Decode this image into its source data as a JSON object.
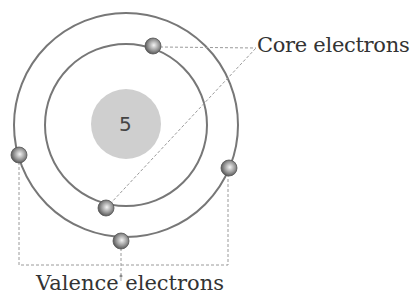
{
  "diagram": {
    "nucleus": {
      "label": "5",
      "color": "#cfcfcf",
      "cx": 126,
      "cy": 124,
      "r": 35
    },
    "orbits": [
      {
        "name": "inner-shell",
        "cx": 126,
        "cy": 125,
        "r": 81,
        "color": "#777777"
      },
      {
        "name": "outer-shell",
        "cx": 126,
        "cy": 125,
        "r": 112,
        "color": "#777777"
      }
    ],
    "electrons": [
      {
        "shell": "inner",
        "type": "core",
        "cx": 153,
        "cy": 46
      },
      {
        "shell": "inner",
        "type": "core",
        "cx": 106,
        "cy": 208
      },
      {
        "shell": "outer",
        "type": "valence",
        "cx": 19,
        "cy": 155
      },
      {
        "shell": "outer",
        "type": "valence",
        "cx": 229,
        "cy": 168
      },
      {
        "shell": "outer",
        "type": "valence",
        "cx": 121,
        "cy": 241
      }
    ],
    "labels": {
      "core": "Core electrons",
      "valence": "Valence electrons"
    },
    "colors": {
      "line": "#777777",
      "dash": "#9a9a9a",
      "text": "#333333",
      "electron_dark": "#555555",
      "electron_light": "#f2f2f2"
    }
  }
}
